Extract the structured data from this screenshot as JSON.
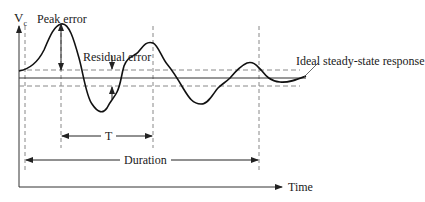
{
  "diagram": {
    "type": "damped-oscillation response diagram",
    "y_axis_label": "V",
    "y_axis_subscript": "c",
    "x_axis_label": "Time",
    "annotations": {
      "peak_error": "Peak error",
      "residual_error": "Residual error",
      "ideal_response": "Ideal steady-state response",
      "period": "T",
      "duration": "Duration"
    },
    "colors": {
      "curve": "#111111",
      "dashed": "#888888",
      "axis": "#333333",
      "background": "#ffffff"
    }
  }
}
